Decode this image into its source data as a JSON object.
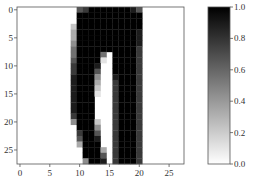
{
  "chart_data": {
    "type": "heatmap",
    "title": "",
    "colormap": "gray_r (0 = white, 1 = black)",
    "xlabel": "",
    "ylabel": "",
    "xlim": [
      -0.5,
      27.5
    ],
    "ylim": [
      27.5,
      -0.5
    ],
    "x_ticks": [
      0,
      5,
      10,
      15,
      20,
      25
    ],
    "y_ticks": [
      0,
      5,
      10,
      15,
      20,
      25
    ],
    "x_tick_labels": [
      "0",
      "5",
      "10",
      "15",
      "20",
      "25"
    ],
    "y_tick_labels": [
      "0",
      "5",
      "10",
      "15",
      "20",
      "25"
    ],
    "grid": false,
    "colorbar": {
      "min": 0.0,
      "max": 1.0,
      "ticks": [
        0.0,
        0.2,
        0.4,
        0.6,
        0.8,
        1.0
      ],
      "tick_labels": [
        "0.0",
        "0.2",
        "0.4",
        "0.6",
        "0.8",
        "1.0"
      ]
    },
    "rows": [
      "0000000000679999999860000000",
      "0000000000999999999990000000",
      "0000000000999999999990000000",
      "0000000002999999999990000000",
      "0000000003999999999980000000",
      "0000000003999999999980000000",
      "0000000004999999999980000000",
      "0000000005999999999970000000",
      "0000000005999950999970000000",
      "0000000006999910999970000000",
      "0000000007999800999970000000",
      "0000000007999600999970000000",
      "0000000008999400899970000000",
      "0000000008999300799970000000",
      "0000000008999200799970000000",
      "0000000008999100799970000000",
      "0000000008999000799970000000",
      "0000000008999000799970000000",
      "0000000008999000799970000000",
      "0000000007999000799970000000",
      "0000000004999200799970000000",
      "0000000000999400799970000000",
      "0000000000799600799970000000",
      "0000000000699800799970000000",
      "0000000000399900799970000000",
      "0000000000099930799970000000",
      "0000000000099960799970000000",
      "0000000000049980799970000000"
    ],
    "row_encoding": "each digit d in 0-9 = pixel intensity d/9"
  },
  "colors": {
    "axes_frame": "#555555",
    "tick_label": "#333333",
    "background": "#ffffff",
    "max_color": "#000000",
    "min_color": "#ffffff"
  }
}
